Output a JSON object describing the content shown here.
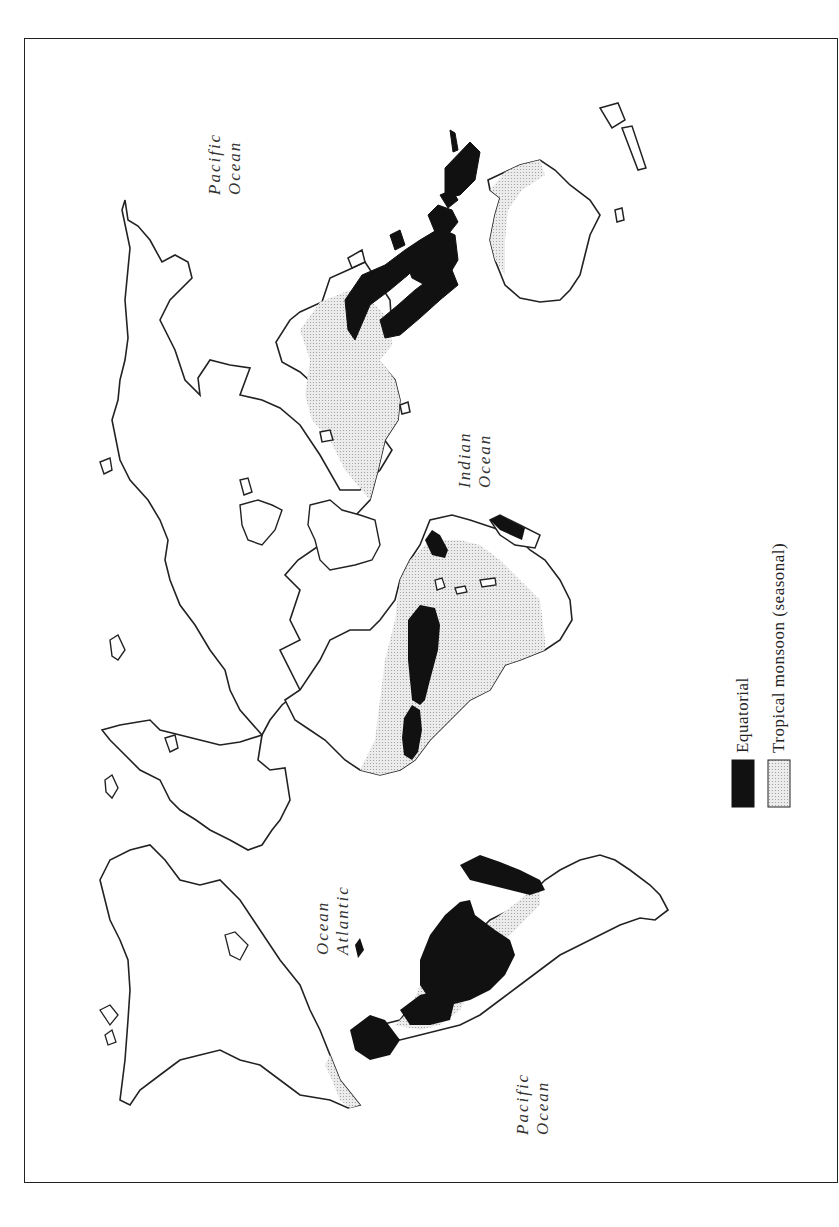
{
  "map": {
    "orientation": "rotated 90° counter-clockwise",
    "ocean_labels": [
      {
        "line1": "Pacific",
        "line2": "Ocean"
      },
      {
        "line1": "Indian",
        "line2": "Ocean"
      },
      {
        "line1": "Ocean",
        "line2": "Atlantic"
      },
      {
        "line1": "Pacific",
        "line2": "Ocean"
      }
    ]
  },
  "legend": {
    "items": [
      {
        "label": "Equatorial",
        "fill": "#111111"
      },
      {
        "label": "Tropical monsoon (seasonal)",
        "fill": "#e4e4e4"
      }
    ]
  },
  "colors": {
    "equatorial": "#111111",
    "monsoon": "#e4e4e4",
    "outline": "#222222",
    "background": "#ffffff"
  }
}
